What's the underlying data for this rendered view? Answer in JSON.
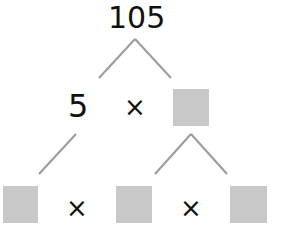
{
  "diagram": {
    "type": "factor-tree",
    "root": "105",
    "level1": {
      "left": "5",
      "operator": "×",
      "right": ""
    },
    "level2": {
      "items": [
        "",
        "×",
        "",
        "×",
        ""
      ]
    },
    "colors": {
      "line": "#9a9a9a",
      "box": "#c8c8c8",
      "text": "#111111"
    }
  }
}
